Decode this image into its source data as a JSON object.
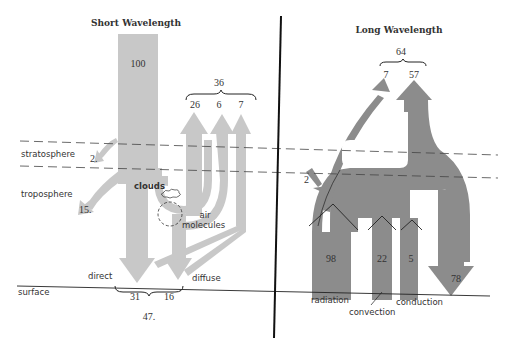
{
  "colors": {
    "short_wave": "#c8c8c8",
    "long_wave": "#8c8c8c",
    "lines": "#222222",
    "text": "#333333"
  },
  "left_panel": {
    "title": "Short Wavelength",
    "layers": {
      "stratosphere": "stratosphere",
      "troposphere": "troposphere",
      "surface": "surface"
    },
    "incoming": "100",
    "reflected_total": "36",
    "reflected": [
      "26",
      "6",
      "7"
    ],
    "absorbed_stratosphere": "2.",
    "absorbed_troposphere": "15.",
    "labels": {
      "clouds": "clouds",
      "air": "air",
      "molecules": "molecules",
      "direct": "direct",
      "diffuse": "diffuse"
    },
    "surface_values": [
      "31",
      "16"
    ],
    "surface_total": "47."
  },
  "right_panel": {
    "title": "Long Wavelength",
    "emitted_total": "64",
    "emitted": [
      "7",
      "57"
    ],
    "absorbed_input": "2",
    "surface_fluxes": [
      "98",
      "22",
      "5"
    ],
    "back_radiation": "78",
    "labels": {
      "radiation": "radiation",
      "convection": "convection",
      "conduction": "conduction"
    }
  }
}
